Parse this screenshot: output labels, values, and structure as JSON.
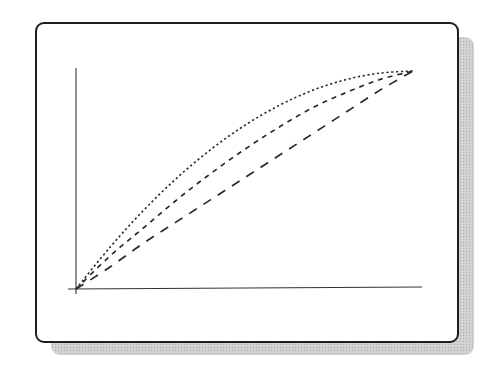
{
  "figure": {
    "colors": {
      "frame": "#1e1e1e",
      "axes": "#333333",
      "curves": "#2a2a2a",
      "shadow": "#cfcfcf",
      "background": "#ffffff"
    }
  },
  "chart_data": {
    "type": "line",
    "title": "",
    "xlabel": "",
    "ylabel": "",
    "xlim": [
      0,
      1.03
    ],
    "ylim": [
      0,
      1.02
    ],
    "grid": false,
    "legend": null,
    "ticks": false,
    "series": [
      {
        "name": "dotted-curve",
        "style": "dotted",
        "x": [
          0,
          0.1,
          0.2,
          0.3,
          0.4,
          0.5,
          0.6,
          0.7,
          0.8,
          0.9,
          1.0
        ],
        "y": [
          0,
          0.19,
          0.36,
          0.51,
          0.64,
          0.75,
          0.84,
          0.91,
          0.96,
          0.99,
          1.0
        ]
      },
      {
        "name": "medium-dashed-curve",
        "style": "dashed",
        "x": [
          0,
          0.1,
          0.2,
          0.3,
          0.4,
          0.5,
          0.6,
          0.7,
          0.8,
          0.9,
          1.0
        ],
        "y": [
          0,
          0.15,
          0.28,
          0.41,
          0.53,
          0.64,
          0.74,
          0.83,
          0.9,
          0.96,
          1.0
        ]
      },
      {
        "name": "long-dashed-curve",
        "style": "long-dashed",
        "x": [
          0,
          0.1,
          0.2,
          0.3,
          0.4,
          0.5,
          0.6,
          0.7,
          0.8,
          0.9,
          1.0
        ],
        "y": [
          0,
          0.1,
          0.21,
          0.31,
          0.41,
          0.51,
          0.61,
          0.71,
          0.81,
          0.91,
          1.0
        ]
      }
    ]
  }
}
